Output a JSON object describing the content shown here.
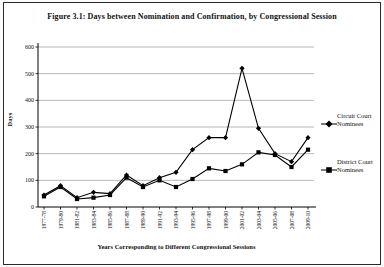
{
  "figure": {
    "title": "Figure 3.1: Days between Nomination and Confirmation, by Congressional Session"
  },
  "chart_data": {
    "type": "line",
    "title": "Figure 3.1: Days between Nomination and Confirmation, by Congressional Session",
    "xlabel": "Years Corresponding to Different Congressional Sessions",
    "ylabel": "Days",
    "ylim": [
      0,
      600
    ],
    "yticks": [
      0,
      100,
      200,
      300,
      400,
      500,
      600
    ],
    "grid": "horizontal-only",
    "legend_position": "right",
    "line_color": "#000000",
    "grid_color": "#9a9a9a",
    "categories": [
      "1977-78",
      "1979-80",
      "1981-82",
      "1983-84",
      "1985-86",
      "1987-88",
      "1989-90",
      "1991-92",
      "1993-94",
      "1995-96",
      "1997-98",
      "1999-00",
      "2001-02",
      "2003-04",
      "2005-06",
      "2007-08",
      "2009-10"
    ],
    "series": [
      {
        "name": "Circuit Court Nominees",
        "marker": "diamond",
        "color": "#000000",
        "values": [
          45,
          80,
          35,
          55,
          50,
          120,
          80,
          110,
          130,
          215,
          260,
          260,
          520,
          295,
          200,
          170,
          260
        ]
      },
      {
        "name": "District Court Nominees",
        "marker": "square",
        "color": "#000000",
        "values": [
          40,
          75,
          30,
          35,
          45,
          110,
          75,
          100,
          75,
          105,
          145,
          135,
          160,
          205,
          195,
          150,
          215
        ]
      }
    ]
  }
}
